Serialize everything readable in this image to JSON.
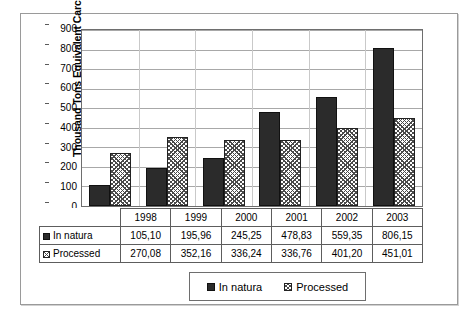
{
  "chart_data": {
    "type": "bar",
    "title": "",
    "xlabel": "",
    "ylabel": "Thousand Tons Equivalent Carcass",
    "categories": [
      "1998",
      "1999",
      "2000",
      "2001",
      "2002",
      "2003"
    ],
    "series": [
      {
        "name": "In natura",
        "values": [
          105.1,
          195.96,
          245.25,
          478.83,
          559.35,
          806.15
        ],
        "labels": [
          "105,10",
          "195,96",
          "245,25",
          "478,83",
          "559,35",
          "806,15"
        ],
        "swatch": "dark"
      },
      {
        "name": "Processed",
        "values": [
          270.08,
          352.16,
          336.24,
          336.76,
          401.2,
          451.01
        ],
        "labels": [
          "270,08",
          "352,16",
          "336,24",
          "336,76",
          "401,20",
          "451,01"
        ],
        "swatch": "hatch"
      }
    ],
    "ylim": [
      0,
      900
    ],
    "ytick_step": 100,
    "yticks": [
      "0",
      "100",
      "200",
      "300",
      "400",
      "500",
      "600",
      "700",
      "800",
      "900"
    ],
    "grid": true,
    "legend_position": "bottom",
    "colors": {
      "in_natura": "#2b2b2b",
      "processed": "#ffffff",
      "gridline": "#a8a8a8",
      "axis": "#6e6e6e"
    }
  },
  "data_table": {
    "corner_label": "",
    "column_headers": [
      "1998",
      "1999",
      "2000",
      "2001",
      "2002",
      "2003"
    ],
    "rows": [
      {
        "label": "In natura",
        "swatch": "dark",
        "cells": [
          "105,10",
          "195,96",
          "245,25",
          "478,83",
          "559,35",
          "806,15"
        ]
      },
      {
        "label": "Processed",
        "swatch": "hatch",
        "cells": [
          "270,08",
          "352,16",
          "336,24",
          "336,76",
          "401,20",
          "451,01"
        ]
      }
    ]
  },
  "legend": {
    "items": [
      {
        "label": "In natura",
        "swatch": "dark"
      },
      {
        "label": "Processed",
        "swatch": "hatch"
      }
    ]
  }
}
